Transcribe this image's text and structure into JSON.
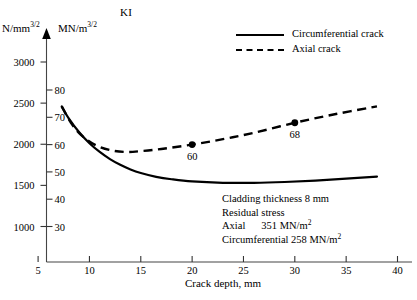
{
  "chart_data": {
    "type": "line",
    "title": "KI",
    "xlabel": "Crack depth, mm",
    "ylabel_left": "N/mm",
    "ylabel_left_exp": "3/2",
    "ylabel_right": "MN/m",
    "ylabel_right_exp": "3/2",
    "xlim": [
      3.5,
      41
    ],
    "xticks": [
      5,
      10,
      15,
      20,
      25,
      30,
      35,
      40
    ],
    "yticks_left": [
      1000,
      1500,
      2000,
      2500,
      3000
    ],
    "yticks_right": [
      30,
      40,
      50,
      60,
      70,
      80
    ],
    "ylim_right": [
      25.5,
      88
    ],
    "grid": false,
    "legend_position": "top-right",
    "series": [
      {
        "name": "Circumferential crack",
        "style": "solid",
        "points": [
          [
            7.3,
            74.0
          ],
          [
            8.0,
            69.5
          ],
          [
            9.0,
            64.5
          ],
          [
            10.0,
            60.5
          ],
          [
            11.0,
            57.3
          ],
          [
            12.0,
            54.7
          ],
          [
            13.0,
            52.6
          ],
          [
            14.0,
            50.9
          ],
          [
            15.0,
            49.6
          ],
          [
            16.5,
            48.2
          ],
          [
            18.0,
            47.3
          ],
          [
            20.0,
            46.5
          ],
          [
            23.0,
            46.0
          ],
          [
            26.0,
            46.0
          ],
          [
            29.0,
            46.3
          ],
          [
            32.0,
            46.8
          ],
          [
            35.0,
            47.5
          ],
          [
            38.0,
            48.3
          ]
        ]
      },
      {
        "name": "Axial crack",
        "style": "dashed",
        "points": [
          [
            7.3,
            74.0
          ],
          [
            8.2,
            68.0
          ],
          [
            9.2,
            63.5
          ],
          [
            10.5,
            60.0
          ],
          [
            12.0,
            58.0
          ],
          [
            13.5,
            57.3
          ],
          [
            15.0,
            57.6
          ],
          [
            17.0,
            58.4
          ],
          [
            20.0,
            60.0
          ],
          [
            23.0,
            62.0
          ],
          [
            26.0,
            64.3
          ],
          [
            30.0,
            68.0
          ],
          [
            34.0,
            71.2
          ],
          [
            38.0,
            74.0
          ]
        ]
      }
    ],
    "annotated_points": [
      {
        "x": 20,
        "y": 60,
        "label": "60",
        "series": "Axial crack"
      },
      {
        "x": 30,
        "y": 68,
        "label": "68",
        "series": "Axial crack"
      }
    ],
    "annotations": {
      "cladding_thickness": "Cladding thickness 8 mm",
      "residual_stress_heading": "Residual stress",
      "axial_label": "Axial",
      "axial_value": "351 MN/m",
      "axial_value_exp": "2",
      "circumferential_label": "Circumferential",
      "circumferential_value": "258 MN/m",
      "circumferential_value_exp": "2"
    },
    "colors": {
      "line": "#000000",
      "axis": "#555555",
      "background": "#ffffff"
    }
  }
}
